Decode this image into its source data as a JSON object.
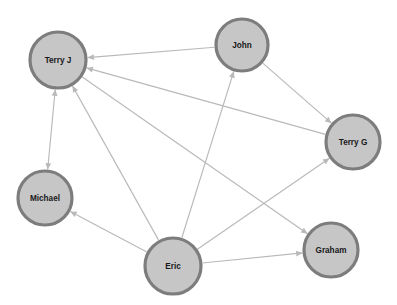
{
  "graph": {
    "title": "Directed social network graph",
    "canvas": {
      "width": 397,
      "height": 305
    },
    "style": {
      "background_color": "#ffffff",
      "node_fill": "#c6c6c6",
      "node_stroke": "#7d7d7d",
      "node_stroke_width": 3.2,
      "edge_color": "#b9b9b9",
      "edge_width": 1.15,
      "label_color": "#18181a",
      "label_size": 8.2
    },
    "nodes": [
      {
        "id": "terry_j",
        "label": "Terry J",
        "x": 58,
        "y": 60,
        "r": 28
      },
      {
        "id": "john",
        "label": "John",
        "x": 242,
        "y": 45,
        "r": 26
      },
      {
        "id": "terry_g",
        "label": "Terry G",
        "x": 353,
        "y": 142,
        "r": 27
      },
      {
        "id": "michael",
        "label": "Michael",
        "x": 45,
        "y": 198,
        "r": 27
      },
      {
        "id": "eric",
        "label": "Eric",
        "x": 173,
        "y": 266,
        "r": 28
      },
      {
        "id": "graham",
        "label": "Graham",
        "x": 331,
        "y": 250,
        "r": 27
      }
    ],
    "edges": [
      {
        "id": "e1",
        "source": "john",
        "target": "terry_j",
        "directed": true,
        "bidirectional": false
      },
      {
        "id": "e2",
        "source": "terry_g",
        "target": "terry_j",
        "directed": true,
        "bidirectional": false
      },
      {
        "id": "e3",
        "source": "eric",
        "target": "terry_j",
        "directed": true,
        "bidirectional": false
      },
      {
        "id": "e4",
        "source": "terry_j",
        "target": "michael",
        "directed": true,
        "bidirectional": true
      },
      {
        "id": "e5",
        "source": "john",
        "target": "terry_g",
        "directed": true,
        "bidirectional": false
      },
      {
        "id": "e6",
        "source": "eric",
        "target": "john",
        "directed": true,
        "bidirectional": false
      },
      {
        "id": "e7",
        "source": "eric",
        "target": "terry_g",
        "directed": true,
        "bidirectional": false
      },
      {
        "id": "e8",
        "source": "eric",
        "target": "graham",
        "directed": true,
        "bidirectional": false
      },
      {
        "id": "e9",
        "source": "eric",
        "target": "michael",
        "directed": true,
        "bidirectional": false
      },
      {
        "id": "e10",
        "source": "terry_j",
        "target": "graham",
        "directed": true,
        "bidirectional": false
      }
    ]
  }
}
